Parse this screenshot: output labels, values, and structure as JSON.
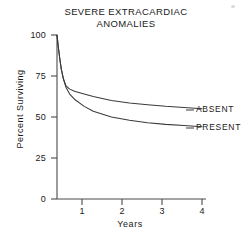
{
  "chart_data": {
    "type": "line",
    "title": "SEVERE EXTRACARDIAC\nANOMALIES",
    "title_line1": "SEVERE EXTRACARDIAC",
    "title_line2": "ANOMALIES",
    "xlabel": "Years",
    "ylabel": "Percent Surviving",
    "xlim": [
      0,
      4
    ],
    "ylim": [
      0,
      100
    ],
    "xticks": [
      0,
      1,
      2,
      3,
      4
    ],
    "xtick_labels": [
      "0",
      "1",
      "2",
      "3",
      "4"
    ],
    "yticks": [
      0,
      25,
      50,
      75,
      100
    ],
    "ytick_labels": [
      "0",
      "25",
      "50",
      "75",
      "100"
    ],
    "grid": false,
    "legend_position": "right-inline",
    "line_color": "#3a3a3a",
    "axis_color": "#4a4a4a",
    "series": [
      {
        "name": "ABSENT",
        "label": "ABSENT",
        "x": [
          0,
          0.04,
          0.08,
          0.12,
          0.18,
          0.25,
          0.35,
          0.5,
          0.75,
          1.0,
          1.5,
          2.0,
          2.5,
          3.0,
          3.5,
          4.0
        ],
        "values": [
          100,
          92,
          85,
          79,
          73,
          69,
          67,
          65.5,
          64,
          62.5,
          60,
          58.5,
          57.5,
          56.5,
          55.8,
          55
        ]
      },
      {
        "name": "PRESENT",
        "label": "PRESENT",
        "x": [
          0,
          0.04,
          0.08,
          0.12,
          0.18,
          0.25,
          0.35,
          0.5,
          0.75,
          1.0,
          1.5,
          2.0,
          2.5,
          3.0,
          3.5,
          4.0
        ],
        "values": [
          100,
          92,
          85,
          79,
          73,
          68,
          64,
          60.5,
          56.5,
          53.5,
          50,
          48,
          46.5,
          45.5,
          44.8,
          44
        ]
      }
    ]
  },
  "annotations": {
    "absent_leader_note": "leader line from ABSENT curve end to label",
    "present_leader_note": "leader line from PRESENT curve end to label"
  }
}
